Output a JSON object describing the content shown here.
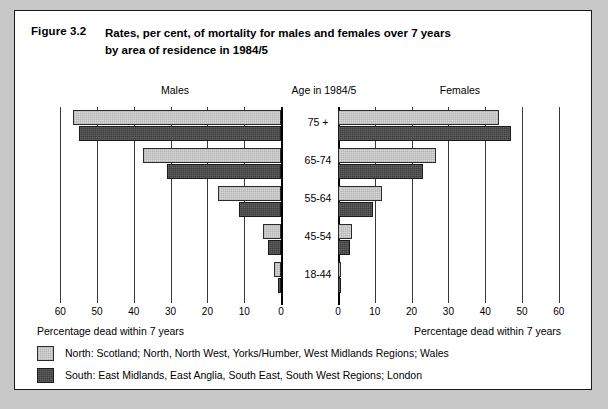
{
  "figure": {
    "number": "Figure 3.2",
    "title_line1": "Rates, per cent, of mortality for males and females over 7 years",
    "title_line2": "by area of residence in 1984/5"
  },
  "headings": {
    "left": "Males",
    "center": "Age in 1984/5",
    "right": "Females"
  },
  "axis_caption": {
    "left": "Percentage dead within 7 years",
    "right": "Percentage dead within 7 years"
  },
  "legend": [
    {
      "key": "north",
      "swatch_color": "#d9d9d9",
      "label": "North: Scotland; North, North West, Yorks/Humber, West Midlands Regions; Wales"
    },
    {
      "key": "south",
      "swatch_color": "#3c3c3c",
      "label": "South: East Midlands, East Anglia, South East, South West Regions; London"
    }
  ],
  "ticks": {
    "left": [
      "60",
      "50",
      "40",
      "30",
      "20",
      "10",
      "0"
    ],
    "right": [
      "0",
      "10",
      "20",
      "30",
      "40",
      "50",
      "60"
    ]
  },
  "chart_data": {
    "type": "bar",
    "title": "Rates, per cent, of mortality for males and females over 7 years by area of residence in 1984/5",
    "subtitle": "Figure 3.2",
    "orientation": "horizontal",
    "layout": "back-to-back population pyramid",
    "categories": [
      "75 +",
      "65-74",
      "55-64",
      "45-54",
      "18-44"
    ],
    "category_axis_label": "Age in 1984/5",
    "xlabel": "Percentage dead within 7 years",
    "ylabel": "Age in 1984/5",
    "xlim": [
      0,
      60
    ],
    "xticks": [
      0,
      10,
      20,
      30,
      40,
      50,
      60
    ],
    "grid": true,
    "legend_position": "bottom-left",
    "panels": [
      {
        "name": "Males",
        "direction": "left",
        "series": [
          {
            "name": "North",
            "color": "#d9d9d9",
            "values": [
              56.5,
              37.5,
              17.0,
              5.0,
              1.8
            ]
          },
          {
            "name": "South",
            "color": "#3c3c3c",
            "values": [
              55.0,
              31.0,
              11.5,
              3.5,
              0.8
            ]
          }
        ]
      },
      {
        "name": "Females",
        "direction": "right",
        "series": [
          {
            "name": "North",
            "color": "#d9d9d9",
            "values": [
              43.8,
              26.5,
              12.0,
              3.8,
              0.6
            ]
          },
          {
            "name": "South",
            "color": "#3c3c3c",
            "values": [
              47.0,
              23.0,
              9.5,
              3.2,
              0.6
            ]
          }
        ]
      }
    ]
  }
}
